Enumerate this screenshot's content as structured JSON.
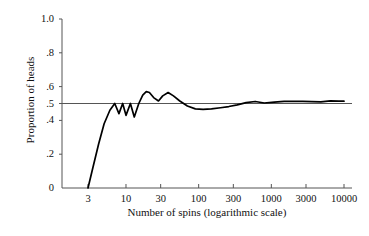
{
  "chart_data": {
    "type": "line",
    "title": "",
    "xlabel": "Number of spins (logarithmic scale)",
    "ylabel": "Proportion of heads",
    "xscale": "log",
    "xlim": [
      2.2,
      13000
    ],
    "ylim": [
      0,
      1
    ],
    "grid": false,
    "legend": null,
    "xticks": [
      {
        "value": 3,
        "label": "3"
      },
      {
        "value": 10,
        "label": "10"
      },
      {
        "value": 30,
        "label": "30"
      },
      {
        "value": 100,
        "label": "100"
      },
      {
        "value": 300,
        "label": "300"
      },
      {
        "value": 1000,
        "label": "1000"
      },
      {
        "value": 3000,
        "label": "3000"
      },
      {
        "value": 10000,
        "label": "10000"
      }
    ],
    "yticks": [
      {
        "value": 0,
        "label": "0"
      },
      {
        "value": 0.2,
        "label": ".2"
      },
      {
        "value": 0.4,
        "label": ".4"
      },
      {
        "value": 0.5,
        "label": ".5"
      },
      {
        "value": 0.6,
        "label": ".6"
      },
      {
        "value": 0.8,
        "label": ".8"
      },
      {
        "value": 1.0,
        "label": "1.0"
      }
    ],
    "reference_line": {
      "value": 0.5,
      "orientation": "horizontal",
      "color": "#555555"
    },
    "series": [
      {
        "name": "Proportion of heads",
        "color": "#000000",
        "x": [
          3,
          3.5,
          4.2,
          5.0,
          6.0,
          7.0,
          8.0,
          9.0,
          10.0,
          11.5,
          13.0,
          15.0,
          17.0,
          19.0,
          21.0,
          24.0,
          28.0,
          32.0,
          38.0,
          45.0,
          55.0,
          70.0,
          90.0,
          115.0,
          150.0,
          200.0,
          260.0,
          340.0,
          450.0,
          600.0,
          800.0,
          1100.0,
          1500.0,
          2000.0,
          2700.0,
          3600.0,
          4800.0,
          6500.0,
          8500.0,
          10000.0
        ],
        "y": [
          0.0,
          0.12,
          0.26,
          0.38,
          0.46,
          0.5,
          0.44,
          0.5,
          0.43,
          0.5,
          0.42,
          0.5,
          0.55,
          0.57,
          0.565,
          0.535,
          0.515,
          0.545,
          0.565,
          0.545,
          0.515,
          0.485,
          0.468,
          0.465,
          0.468,
          0.475,
          0.482,
          0.492,
          0.505,
          0.512,
          0.503,
          0.508,
          0.512,
          0.512,
          0.512,
          0.511,
          0.51,
          0.516,
          0.514,
          0.514
        ]
      }
    ]
  },
  "axis": {
    "y_axis_name": "y-axis-line",
    "x_axis_name": "x-axis-line"
  }
}
